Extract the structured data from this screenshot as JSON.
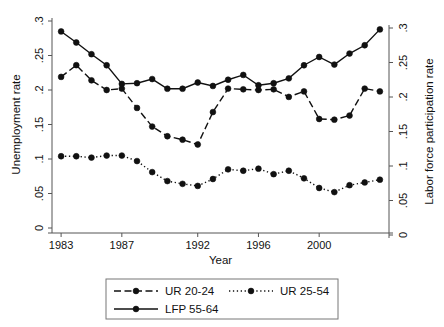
{
  "chart_data": {
    "type": "line",
    "title": "",
    "xlabel": "Year",
    "ylabel": "Unemployment rate",
    "y2label": "Labor force participation rate",
    "x": [
      1983,
      1984,
      1985,
      1986,
      1987,
      1988,
      1989,
      1990,
      1991,
      1992,
      1993,
      1994,
      1995,
      1996,
      1997,
      1998,
      1999,
      2000,
      2001,
      2002,
      2003,
      2004
    ],
    "xlim": [
      1982.4,
      2004.6
    ],
    "ylim": [
      0,
      0.3
    ],
    "y2lim": [
      0,
      0.3
    ],
    "xticks": [
      1983,
      1987,
      1992,
      1996,
      2000
    ],
    "xticklabels": [
      "1983",
      "1987",
      "1992",
      "1996",
      "2000"
    ],
    "yticks": [
      0,
      0.05,
      0.1,
      0.15,
      0.2,
      0.25,
      0.3
    ],
    "yticklabels": [
      "0",
      ".05",
      ".1",
      ".15",
      ".2",
      ".25",
      ".3"
    ],
    "y2ticks": [
      0,
      0.05,
      0.1,
      0.15,
      0.2,
      0.25,
      0.3
    ],
    "y2ticklabels": [
      "0",
      ".05",
      ".1",
      ".15",
      ".2",
      ".25",
      ".3"
    ],
    "grid": false,
    "legend_position": "below",
    "series": [
      {
        "name": "UR 20-24",
        "axis": "left",
        "style": "dashed",
        "marker": "circle",
        "values": [
          0.219,
          0.236,
          0.214,
          0.2,
          0.202,
          0.174,
          0.147,
          0.133,
          0.128,
          0.121,
          0.168,
          0.202,
          0.201,
          0.2,
          0.201,
          0.19,
          0.198,
          0.158,
          0.157,
          0.163,
          0.202,
          0.198
        ]
      },
      {
        "name": "UR 25-54",
        "axis": "left",
        "style": "dotted",
        "marker": "circle",
        "values": [
          0.104,
          0.104,
          0.102,
          0.105,
          0.105,
          0.097,
          0.081,
          0.068,
          0.064,
          0.061,
          0.071,
          0.085,
          0.083,
          0.086,
          0.078,
          0.083,
          0.072,
          0.058,
          0.052,
          0.062,
          0.066,
          0.07
        ]
      },
      {
        "name": "LFP 55-64",
        "axis": "right",
        "style": "solid",
        "marker": "circle",
        "values": [
          0.295,
          0.279,
          0.262,
          0.246,
          0.219,
          0.22,
          0.226,
          0.212,
          0.212,
          0.221,
          0.216,
          0.225,
          0.232,
          0.217,
          0.22,
          0.227,
          0.246,
          0.258,
          0.247,
          0.263,
          0.275,
          0.298
        ]
      }
    ]
  },
  "legend": {
    "entries": [
      {
        "label": "UR 20-24"
      },
      {
        "label": "UR 25-54"
      },
      {
        "label": "LFP 55-64"
      }
    ]
  }
}
